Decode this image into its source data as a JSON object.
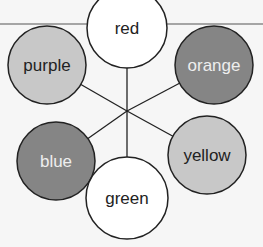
{
  "diagram": {
    "nodes": [
      {
        "id": "red",
        "label": "red",
        "cx": 127,
        "cy": 28,
        "r": 40,
        "fill": "#ffffff",
        "text": "#222222"
      },
      {
        "id": "purple",
        "label": "purple",
        "cx": 47,
        "cy": 65,
        "r": 39,
        "fill": "#c8c8c8",
        "text": "#222222"
      },
      {
        "id": "orange",
        "label": "orange",
        "cx": 214,
        "cy": 65,
        "r": 39,
        "fill": "#858585",
        "text": "#eeeeee"
      },
      {
        "id": "blue",
        "label": "blue",
        "cx": 56,
        "cy": 161,
        "r": 39,
        "fill": "#858585",
        "text": "#eeeeee"
      },
      {
        "id": "yellow",
        "label": "yellow",
        "cx": 207,
        "cy": 155,
        "r": 39,
        "fill": "#c8c8c8",
        "text": "#222222"
      },
      {
        "id": "green",
        "label": "green",
        "cx": 127,
        "cy": 198,
        "r": 41,
        "fill": "#ffffff",
        "text": "#222222"
      }
    ],
    "center": {
      "x": 127,
      "y": 111
    },
    "topline_y": 24
  }
}
